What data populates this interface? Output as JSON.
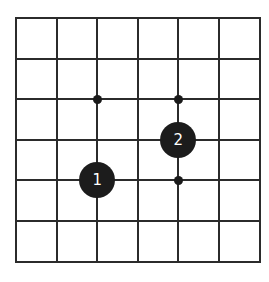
{
  "board": {
    "size": 7,
    "origin": {
      "x": 16,
      "y": 18
    },
    "spacing": 40.6,
    "line_color": "#2b2b2b",
    "background": "#ffffff",
    "star_points": [
      {
        "col": 2,
        "row": 2
      },
      {
        "col": 4,
        "row": 2
      },
      {
        "col": 4,
        "row": 4
      }
    ],
    "stones": [
      {
        "col": 2,
        "row": 4,
        "color": "black",
        "label": "1"
      },
      {
        "col": 4,
        "row": 3,
        "color": "black",
        "label": "2"
      }
    ]
  }
}
